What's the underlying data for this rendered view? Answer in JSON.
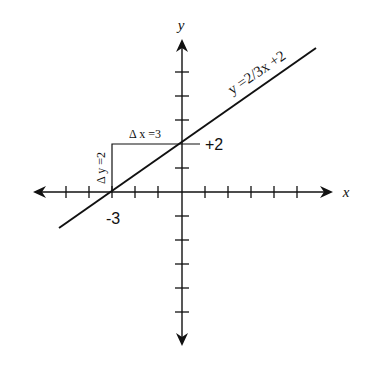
{
  "diagram": {
    "colors": {
      "ink": "#111111",
      "background": "#ffffff"
    },
    "axes": {
      "x_label": "x",
      "y_label": "y",
      "origin_px": [
        182,
        192
      ],
      "unit_px_x": 23.3,
      "unit_px_y": 24,
      "x_ticks": [
        -6,
        -5,
        -4,
        -3,
        -2,
        -1,
        1,
        2,
        3,
        4,
        5
      ],
      "y_ticks": [
        6,
        5,
        4,
        3,
        2,
        1,
        -1,
        -2,
        -3,
        -4,
        -5,
        -6
      ]
    },
    "line": {
      "equation_label": "y =2/3x +2",
      "slope": "2/3",
      "y_intercept": 2,
      "x_intercept": -3
    },
    "slope_triangle": {
      "dx_label": "Δ x =3",
      "dy_label": "Δ y =2"
    },
    "point_labels": {
      "x_intercept_label": "-3",
      "y_intercept_label": "+2"
    }
  }
}
